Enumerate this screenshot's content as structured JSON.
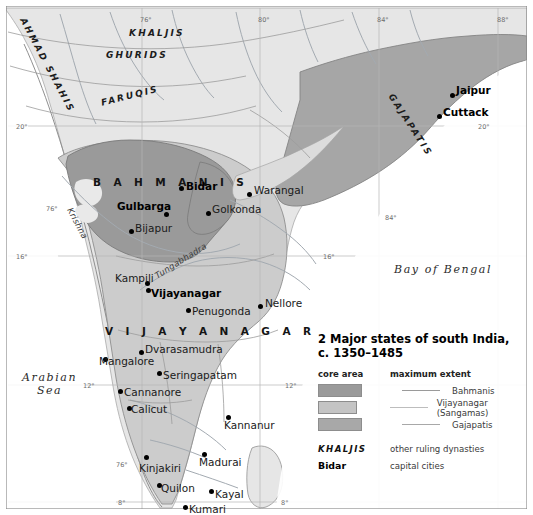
{
  "map": {
    "frame_color": "#8a8a8a",
    "background": "#ffffff",
    "land_color": "#e3e3e3",
    "bahmani_color": "#9a9a9a",
    "vijayanagar_color": "#c8c8c8",
    "gajapati_color": "#a8a8a8",
    "border_line": "#7d7d7d",
    "river_color": "#9fa6ad",
    "seas": [
      {
        "name": "Arabian Sea",
        "line1": "Arabian",
        "line2": "Sea",
        "x": 22,
        "y": 371
      },
      {
        "name": "Bay of Bengal",
        "line1": "Bay of Bengal",
        "line2": "",
        "x": 394,
        "y": 263
      }
    ],
    "dynasties": [
      {
        "label": "AHMAD SHAHIS",
        "x": 27,
        "y": 16,
        "rot": "rot-ahmad"
      },
      {
        "label": "KHALJIS",
        "x": 129,
        "y": 28,
        "rot": ""
      },
      {
        "label": "GHURIDS",
        "x": 106,
        "y": 50,
        "rot": ""
      },
      {
        "label": "FARUQIS",
        "x": 100,
        "y": 98,
        "rot": "rot-faruqis"
      },
      {
        "label": "GAJAPATIS",
        "x": 395,
        "y": 92,
        "rot": "rot-gaja"
      }
    ],
    "regions": [
      {
        "label": "B A H M A N I S",
        "x": 93,
        "y": 176
      },
      {
        "label": "V I J A Y A N A G A R",
        "x": 105,
        "y": 325
      }
    ],
    "rivers": [
      {
        "label": "Krishna",
        "x": 74,
        "y": 206,
        "rot": "rot-krishna"
      },
      {
        "label": "Tungabhadra",
        "x": 153,
        "y": 272,
        "rot": "rot-tunga"
      }
    ],
    "capitals": [
      {
        "label": "Bidar",
        "dot_x": 179,
        "dot_y": 186,
        "text_x": 186,
        "text_y": 180
      },
      {
        "label": "Gulbarga",
        "dot_x": 164,
        "dot_y": 212,
        "text_x": 117,
        "text_y": 200
      },
      {
        "label": "Vijayanagar",
        "dot_x": 146,
        "dot_y": 288,
        "text_x": 151,
        "text_y": 287
      },
      {
        "label": "Jaipur",
        "dot_x": 450,
        "dot_y": 93,
        "text_x": 456,
        "text_y": 84
      },
      {
        "label": "Cuttack",
        "dot_x": 437,
        "dot_y": 114,
        "text_x": 443,
        "text_y": 106
      }
    ],
    "cities": [
      {
        "label": "Warangal",
        "dot_x": 247,
        "dot_y": 192,
        "text_x": 254,
        "text_y": 184
      },
      {
        "label": "Golkonda",
        "dot_x": 206,
        "dot_y": 211,
        "text_x": 212,
        "text_y": 203
      },
      {
        "label": "Bijapur",
        "dot_x": 129,
        "dot_y": 229,
        "text_x": 135,
        "text_y": 222
      },
      {
        "label": "Kampili",
        "dot_x": 145,
        "dot_y": 281,
        "text_x": 115,
        "text_y": 272
      },
      {
        "label": "Penugonda",
        "dot_x": 186,
        "dot_y": 308,
        "text_x": 192,
        "text_y": 305
      },
      {
        "label": "Nellore",
        "dot_x": 258,
        "dot_y": 304,
        "text_x": 265,
        "text_y": 297
      },
      {
        "label": "Dvarasamudra",
        "dot_x": 139,
        "dot_y": 350,
        "text_x": 145,
        "text_y": 343
      },
      {
        "label": "Mangalore",
        "dot_x": 103,
        "dot_y": 357,
        "text_x": 99,
        "text_y": 355
      },
      {
        "label": "Seringapatam",
        "dot_x": 157,
        "dot_y": 371,
        "text_x": 163,
        "text_y": 369
      },
      {
        "label": "Cannanore",
        "dot_x": 118,
        "dot_y": 389,
        "text_x": 124,
        "text_y": 386
      },
      {
        "label": "Calicut",
        "dot_x": 127,
        "dot_y": 406,
        "text_x": 131,
        "text_y": 403
      },
      {
        "label": "Kannanur",
        "dot_x": 226,
        "dot_y": 415,
        "text_x": 224,
        "text_y": 419
      },
      {
        "label": "Madurai",
        "dot_x": 202,
        "dot_y": 452,
        "text_x": 199,
        "text_y": 456
      },
      {
        "label": "Kinjakiri",
        "dot_x": 144,
        "dot_y": 455,
        "text_x": 139,
        "text_y": 462
      },
      {
        "label": "Quilon",
        "dot_x": 157,
        "dot_y": 483,
        "text_x": 161,
        "text_y": 482
      },
      {
        "label": "Kayal",
        "dot_x": 209,
        "dot_y": 489,
        "text_x": 215,
        "text_y": 488
      },
      {
        "label": "Kumari",
        "dot_x": 183,
        "dot_y": 505,
        "text_x": 189,
        "text_y": 503
      }
    ],
    "coordinates": [
      {
        "label": "76°",
        "x": 140,
        "y": 16
      },
      {
        "label": "80°",
        "x": 258,
        "y": 16
      },
      {
        "label": "84°",
        "x": 377,
        "y": 16
      },
      {
        "label": "88°",
        "x": 497,
        "y": 16
      },
      {
        "label": "20°",
        "x": 16,
        "y": 123
      },
      {
        "label": "20°",
        "x": 478,
        "y": 123
      },
      {
        "label": "16°",
        "x": 16,
        "y": 253
      },
      {
        "label": "16°",
        "x": 323,
        "y": 253
      },
      {
        "label": "12°",
        "x": 83,
        "y": 382
      },
      {
        "label": "12°",
        "x": 285,
        "y": 382
      },
      {
        "label": "84°",
        "x": 385,
        "y": 214
      },
      {
        "label": "8°",
        "x": 118,
        "y": 499
      },
      {
        "label": "8°",
        "x": 281,
        "y": 499
      },
      {
        "label": "76°",
        "x": 116,
        "y": 461
      },
      {
        "label": "76°",
        "x": 46,
        "y": 205
      }
    ]
  },
  "legend": {
    "title_line1": "2 Major states of south India,",
    "title_line2": "c. 1350–1485",
    "col_core": "core area",
    "col_extent": "maximum extent",
    "rows": [
      {
        "name": "Bahmanis",
        "swatch": "#9a9a9a",
        "line": "#9a9a9a"
      },
      {
        "name": "Vijayanagar (Sangamas)",
        "swatch": "#c4c4c4",
        "line": "#bdbdbd"
      },
      {
        "name": "Gajapatis",
        "swatch": "#a8a8a8",
        "line": "#a8a8a8"
      }
    ],
    "extra": [
      {
        "key": "KHALJIS",
        "desc": "other ruling dynasties",
        "style": "dynstyle"
      },
      {
        "key": "Bidar",
        "desc": "capital cities",
        "style": "capstyle"
      }
    ]
  }
}
